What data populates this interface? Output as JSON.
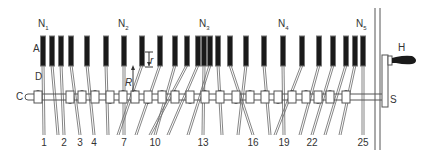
{
  "diagram": {
    "type": "mechanical-schematic",
    "colors": {
      "line": "#555555",
      "bar_fill": "#1a1a1a",
      "bar_edge": "#777777",
      "background": "#ffffff"
    },
    "labels": {
      "A": "A",
      "C": "C",
      "D": "D",
      "R": "R",
      "r": "r",
      "H": "H",
      "S": "S"
    },
    "group_labels": [
      {
        "id": "N1",
        "text": "N",
        "sub": "1",
        "x": 44
      },
      {
        "id": "N2",
        "text": "N",
        "sub": "2",
        "x": 124
      },
      {
        "id": "N3",
        "text": "N",
        "sub": "3",
        "x": 205
      },
      {
        "id": "N4",
        "text": "N",
        "sub": "4",
        "x": 284
      },
      {
        "id": "N5",
        "text": "N",
        "sub": "5",
        "x": 362
      }
    ],
    "rod_numbers": [
      {
        "text": "1",
        "x": 44
      },
      {
        "text": "2",
        "x": 64
      },
      {
        "text": "3",
        "x": 80
      },
      {
        "text": "4",
        "x": 94
      },
      {
        "text": "7",
        "x": 124
      },
      {
        "text": "10",
        "x": 155
      },
      {
        "text": "13",
        "x": 203
      },
      {
        "text": "16",
        "x": 253
      },
      {
        "text": "19",
        "x": 284
      },
      {
        "text": "22",
        "x": 312
      },
      {
        "text": "25",
        "x": 363
      }
    ],
    "bar_x": [
      43,
      52,
      61,
      71,
      87,
      106,
      124,
      142,
      160,
      175,
      187,
      198,
      204,
      210,
      218,
      230,
      246,
      264,
      283,
      302,
      319,
      333,
      346,
      355,
      363
    ],
    "rod_bottom_x": [
      44,
      58,
      64,
      80,
      94,
      108,
      124,
      118,
      136,
      155,
      150,
      168,
      203,
      188,
      222,
      253,
      238,
      270,
      284,
      275,
      300,
      312,
      325,
      340,
      363
    ]
  }
}
